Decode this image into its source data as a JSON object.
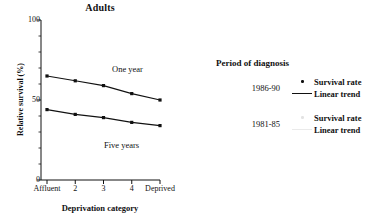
{
  "chart_data": {
    "type": "line",
    "title": "Adults",
    "xlabel": "Deprivation category",
    "ylabel": "Relative survival (%)",
    "categories": [
      "Affluent",
      "2",
      "3",
      "4",
      "Deprived"
    ],
    "ylim": [
      0,
      100
    ],
    "ytick_labels": [
      "0",
      "50",
      "100"
    ],
    "ytick_values": [
      0,
      50,
      100
    ],
    "yminor_step": 10,
    "grid": false,
    "legend_position": "right",
    "series": [
      {
        "name": "One year",
        "period": "1986-90",
        "values": [
          65,
          62,
          59,
          54,
          50
        ],
        "annotation": "One year"
      },
      {
        "name": "Five years",
        "period": "1986-90",
        "values": [
          44,
          41,
          39,
          36,
          34
        ],
        "annotation": "Five years"
      }
    ]
  },
  "legend": {
    "title": "Period of diagnosis",
    "groups": [
      {
        "period": "1986-90",
        "keys": [
          {
            "marker": "dot",
            "label": "Survival rate"
          },
          {
            "marker": "line",
            "label": "Linear trend"
          }
        ]
      },
      {
        "period": "1981-85",
        "keys": [
          {
            "marker": "dot-faint",
            "label": "Survival rate"
          },
          {
            "marker": "line-faint",
            "label": "Linear trend"
          }
        ]
      }
    ]
  }
}
